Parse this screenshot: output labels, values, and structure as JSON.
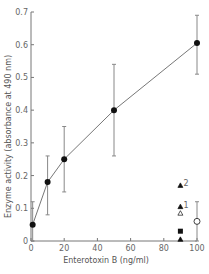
{
  "chart_data": {
    "type": "line",
    "title": "",
    "xlabel": "Enterotoxin B (ng/ml)",
    "ylabel": "Enzyme activity (absorbance at 490 nm)",
    "xlim": [
      0,
      100
    ],
    "ylim": [
      0,
      0.7
    ],
    "xticks": [
      "0",
      "20",
      "40",
      "60",
      "80",
      "100"
    ],
    "yticks": [
      "0",
      "0.1",
      "0.2",
      "0.3",
      "0.4",
      "0.5",
      "0.6",
      "0.7"
    ],
    "grid": false,
    "series": [
      {
        "name": "Enterotoxin B dose response",
        "marker": "filled-circle",
        "x": [
          1,
          10,
          20,
          50,
          100
        ],
        "y": [
          0.05,
          0.18,
          0.25,
          0.4,
          0.605
        ],
        "error_low": [
          0.0,
          0.08,
          0.15,
          0.26,
          0.51
        ],
        "error_high": [
          0.12,
          0.26,
          0.35,
          0.54,
          0.69
        ]
      },
      {
        "name": "control",
        "marker": "open-circle",
        "x": [
          100
        ],
        "y": [
          0.06
        ],
        "error_low": [
          0.0
        ],
        "error_high": [
          0.12
        ]
      }
    ],
    "annotations": [
      {
        "marker": "filled-triangle",
        "label": "2",
        "x": 90,
        "y": 0.17
      },
      {
        "marker": "filled-triangle",
        "label": "1",
        "x": 90,
        "y": 0.105
      },
      {
        "marker": "open-triangle",
        "label": "",
        "x": 90,
        "y": 0.085
      },
      {
        "marker": "filled-square",
        "label": "",
        "x": 90,
        "y": 0.03
      },
      {
        "marker": "filled-triangle",
        "label": "",
        "x": 90,
        "y": 0.005
      }
    ]
  }
}
